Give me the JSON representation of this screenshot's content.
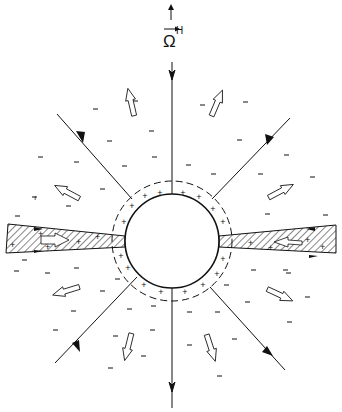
{
  "figure": {
    "label": {
      "symbol": "Ω",
      "superscript": "H",
      "vector_arrow": true,
      "meaning": "angular velocity axis"
    },
    "colors": {
      "ink": "#111111",
      "background": "#ffffff"
    },
    "central_body": {
      "shape": "circle",
      "center": [
        172,
        241
      ],
      "radius": 47,
      "surface_charge": "+",
      "charge_shell_radius": 60,
      "charge_shell_style": "dashed"
    },
    "field_lines": [
      {
        "name": "top",
        "angle_deg": -90,
        "direction": "inward"
      },
      {
        "name": "upper-left",
        "angle_deg": -135,
        "direction": "inward"
      },
      {
        "name": "upper-right",
        "angle_deg": -45,
        "direction": "inward"
      },
      {
        "name": "bottom",
        "angle_deg": 90,
        "direction": "outward"
      },
      {
        "name": "lower-left",
        "angle_deg": 125,
        "direction": "outward"
      },
      {
        "name": "lower-right",
        "angle_deg": 55,
        "direction": "outward"
      }
    ],
    "equatorial_disks": [
      {
        "side": "left",
        "pattern": "hatched",
        "charge": "+"
      },
      {
        "side": "right",
        "pattern": "hatched",
        "charge": "+"
      }
    ],
    "outflow_arrows": 10,
    "space_charge": "−"
  }
}
